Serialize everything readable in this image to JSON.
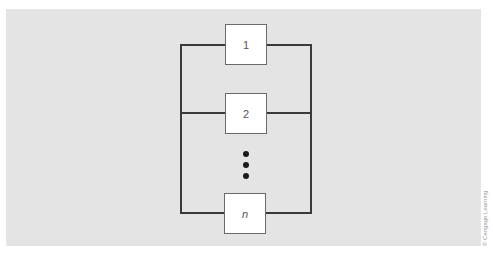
{
  "diagram": {
    "type": "parallel-system-block-diagram",
    "blocks": [
      {
        "label": "1",
        "italic": false
      },
      {
        "label": "2",
        "italic": false
      },
      {
        "label": "n",
        "italic": true
      }
    ],
    "ellipsis": "vertical-dots",
    "colors": {
      "background": "#e4e4e4",
      "block_fill": "#ffffff",
      "wire": "#3a3a3a"
    }
  },
  "credit": "© Cengage Learning"
}
